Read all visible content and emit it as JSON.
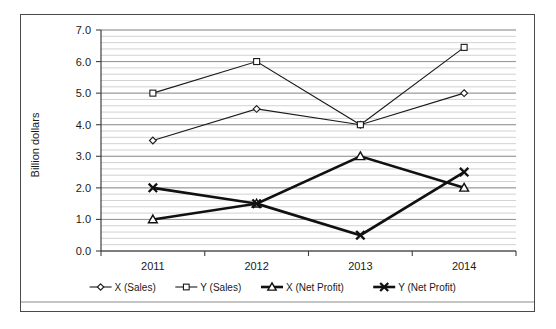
{
  "chart_data": {
    "type": "line",
    "title": "",
    "xlabel": "",
    "ylabel": "Billion dollars",
    "categories": [
      "2011",
      "2012",
      "2013",
      "2014"
    ],
    "ylim": [
      0.0,
      7.0
    ],
    "ytick_labels": [
      "0.0",
      "1.0",
      "2.0",
      "3.0",
      "4.0",
      "5.0",
      "6.0",
      "7.0"
    ],
    "ytick_values": [
      0.0,
      1.0,
      2.0,
      3.0,
      4.0,
      5.0,
      6.0,
      7.0
    ],
    "grid": "horizontal minor and major gridlines",
    "legend_position": "bottom",
    "series": [
      {
        "name": "X (Sales)",
        "marker": "diamond-open",
        "line_weight": "thin",
        "values": [
          3.5,
          4.5,
          4.0,
          5.0
        ]
      },
      {
        "name": "Y (Sales)",
        "marker": "square-open",
        "line_weight": "thin",
        "values": [
          5.0,
          6.0,
          4.0,
          6.45
        ]
      },
      {
        "name": "X (Net Profit)",
        "marker": "triangle-open",
        "line_weight": "thick",
        "values": [
          1.0,
          1.5,
          3.0,
          2.0
        ]
      },
      {
        "name": "Y (Net Profit)",
        "marker": "cross",
        "line_weight": "thick",
        "values": [
          2.0,
          1.5,
          0.5,
          2.5
        ]
      }
    ]
  },
  "legend": {
    "items": [
      {
        "label": "X (Sales)",
        "marker": "diamond-open"
      },
      {
        "label": "Y (Sales)",
        "marker": "square-open"
      },
      {
        "label": "X (Net Profit)",
        "marker": "triangle-open"
      },
      {
        "label": "Y (Net Profit)",
        "marker": "cross"
      }
    ]
  },
  "colors": {
    "line": "#1a1a1a",
    "minor_grid": "#bfbfbf",
    "major_grid": "#8c8c8c",
    "border": "#4a4a4a",
    "background": "#ffffff"
  }
}
